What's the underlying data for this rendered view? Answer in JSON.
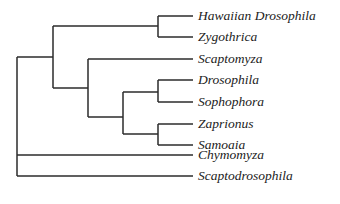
{
  "diagram": {
    "type": "phylogenetic-tree",
    "line_color": "#2b2b2b",
    "taxa": [
      {
        "name": "Hawaiian Drosophila",
        "y": 16
      },
      {
        "name": "Zygothrica",
        "y": 37
      },
      {
        "name": "Scaptomyza",
        "y": 59
      },
      {
        "name": "Drosophila",
        "y": 80
      },
      {
        "name": "Sophophora",
        "y": 102
      },
      {
        "name": "Zaprionus",
        "y": 124
      },
      {
        "name": "Samoaia",
        "y": 145
      },
      {
        "name": "Chymomyza",
        "y": 155
      },
      {
        "name": "Scaptodrosophila",
        "y": 176
      }
    ],
    "newick": "((((Hawaiian Drosophila,Zygothrica),(Scaptomyza,((Drosophila,Sophophora),(Zaprionus,Samoaia)))),Chymomyza),Scaptodrosophila)"
  }
}
